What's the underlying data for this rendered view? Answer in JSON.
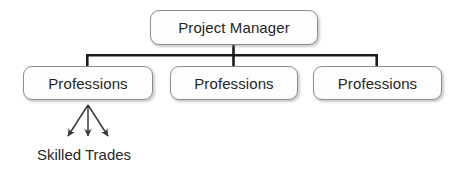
{
  "diagram": {
    "type": "organizational-hierarchy",
    "root": {
      "label": "Project Manager"
    },
    "children": [
      {
        "label": "Professions"
      },
      {
        "label": "Professions"
      },
      {
        "label": "Professions"
      }
    ],
    "leaf": {
      "label": "Skilled Trades",
      "arrow_count": 3
    },
    "colors": {
      "box_border": "#8d8d8d",
      "box_fill": "#fdfdfd",
      "connector": "#1a1a1a",
      "arrow": "#3a3a3a",
      "text": "#262626",
      "background": "#ffffff"
    }
  }
}
